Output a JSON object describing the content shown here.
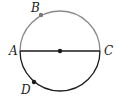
{
  "diagram": {
    "type": "circle-with-diameter",
    "circle": {
      "cx": 60,
      "cy": 51,
      "r": 40
    },
    "colors": {
      "upper_arc": "#8a8a8a",
      "lower_arc": "#1a1a1a",
      "diameter": "#1a1a1a",
      "points": "#1a1a1a",
      "point_B": "#7a7a7a"
    },
    "center": {
      "x": 60,
      "y": 51
    },
    "points": [
      {
        "name": "A",
        "label": "A",
        "x": 20,
        "y": 51,
        "label_x": 9,
        "label_y": 55
      },
      {
        "name": "B",
        "label": "B",
        "x": 41,
        "y": 15,
        "label_x": 31,
        "label_y": 12
      },
      {
        "name": "C",
        "label": "C",
        "x": 100,
        "y": 51,
        "label_x": 104,
        "label_y": 55
      },
      {
        "name": "D",
        "label": "D",
        "x": 34,
        "y": 82,
        "label_x": 21,
        "label_y": 94
      }
    ],
    "segments": [
      {
        "from": "A",
        "to": "C",
        "label": "diameter AC"
      }
    ]
  }
}
